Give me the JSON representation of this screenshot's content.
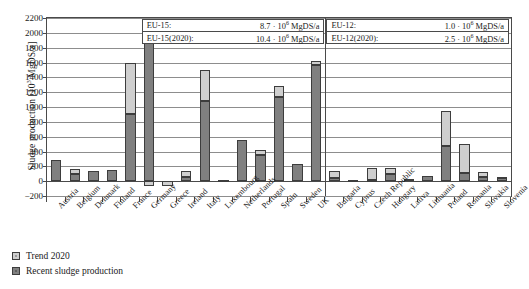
{
  "chart_data": {
    "type": "bar",
    "stacked": true,
    "title": "",
    "xlabel": "",
    "ylabel": "Sludge production [10³ MgDS/a]",
    "ylabel_prefix": "Sludge production [10",
    "ylabel_exp": "3",
    "ylabel_suffix": " MgDS/a]",
    "ylim": [
      -200,
      2200
    ],
    "ytick_step": 200,
    "yticks": [
      2200,
      2000,
      1800,
      1600,
      1400,
      1200,
      1000,
      800,
      600,
      400,
      200,
      0,
      -200
    ],
    "grid": true,
    "legend_position": "below-left",
    "categories": [
      "Austria",
      "Belgium",
      "Denmark",
      "Finland",
      "France",
      "Germany",
      "Greece",
      "Ireland",
      "Italy",
      "Luxembourg",
      "Netherlands",
      "Portugal",
      "Spain",
      "Sweden",
      "UK",
      "Bulgaria",
      "Cyprus",
      "Czech Republic",
      "Hungary",
      "Lativa",
      "Lithuania",
      "Poland",
      "Romania",
      "Slovakia",
      "Slovenia"
    ],
    "group_split_after": "UK",
    "groups": [
      {
        "name": "EU-15",
        "count": 15
      },
      {
        "name": "EU-12",
        "count": 10
      }
    ],
    "series": [
      {
        "name": "Recent sludge production",
        "color": "#808080",
        "values": [
          280,
          100,
          140,
          155,
          910,
          2060,
          0,
          60,
          1080,
          10,
          550,
          350,
          1130,
          230,
          1570,
          40,
          10,
          20,
          100,
          25,
          70,
          480,
          110,
          60,
          55
        ]
      },
      {
        "name": "Trend 2020",
        "color": "#cfcfcf",
        "values": [
          0,
          70,
          0,
          0,
          690,
          -70,
          -70,
          75,
          420,
          0,
          0,
          70,
          150,
          0,
          50,
          100,
          5,
          160,
          80,
          0,
          0,
          470,
          390,
          70,
          5
        ]
      }
    ],
    "annotations": [
      {
        "group": "EU-15",
        "rows": [
          {
            "key": "EU-15:",
            "value_num": "8.7 · 10",
            "value_exp": "6",
            "value_unit": " MgDS/a"
          },
          {
            "key": "EU-15(2020):",
            "value_num": "10.4 · 10",
            "value_exp": "6",
            "value_unit": " MgDS/a"
          }
        ]
      },
      {
        "group": "EU-12",
        "rows": [
          {
            "key": "EU-12:",
            "value_num": "1.0 · 10",
            "value_exp": "6",
            "value_unit": " MgDS/a"
          },
          {
            "key": "EU-12(2020):",
            "value_num": "2.5 · 10",
            "value_exp": "6",
            "value_unit": " MgDS/a"
          }
        ]
      }
    ]
  },
  "legend": {
    "items": [
      {
        "label": "Trend 2020",
        "swatch": "trend"
      },
      {
        "label": "Recent sludge production",
        "swatch": "recent"
      }
    ]
  },
  "annotation_boxes": {
    "eu15": {
      "row1_key": "EU-15:",
      "row1_num": "8.7 · 10",
      "row1_exp": "6",
      "row1_unit": " MgDS/a",
      "row2_key": "EU-15(2020):",
      "row2_num": "10.4 · 10",
      "row2_exp": "6",
      "row2_unit": " MgDS/a"
    },
    "eu12": {
      "row1_key": "EU-12:",
      "row1_num": "1.0 · 10",
      "row1_exp": "6",
      "row1_unit": " MgDS/a",
      "row2_key": "EU-12(2020):",
      "row2_num": "2.5 · 10",
      "row2_exp": "6",
      "row2_unit": " MgDS/a"
    }
  }
}
